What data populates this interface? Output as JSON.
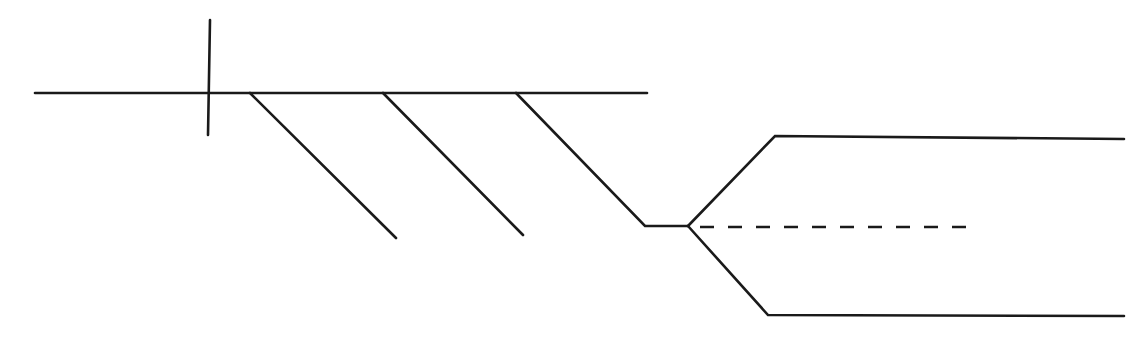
{
  "diagram": {
    "type": "line-drawing",
    "colors": {
      "line": "#1a1a1a",
      "background": "#ffffff"
    },
    "elements": {
      "main_horizontal": {
        "points": [
          [
            35,
            93
          ],
          [
            647,
            93
          ]
        ]
      },
      "vertical_tick": {
        "points": [
          [
            210,
            20
          ],
          [
            208,
            135
          ]
        ]
      },
      "diagonal_1": {
        "points": [
          [
            250,
            93
          ],
          [
            396,
            238
          ]
        ]
      },
      "diagonal_2": {
        "points": [
          [
            383,
            93
          ],
          [
            523,
            235
          ]
        ]
      },
      "diagonal_3_to_fork": {
        "points": [
          [
            516,
            93
          ],
          [
            645,
            226
          ],
          [
            688,
            226
          ]
        ]
      },
      "upper_branch": {
        "points": [
          [
            688,
            226
          ],
          [
            775,
            136
          ],
          [
            1124,
            139
          ]
        ]
      },
      "lower_branch": {
        "points": [
          [
            688,
            226
          ],
          [
            768,
            315
          ],
          [
            1124,
            316
          ]
        ]
      },
      "dashed_centerline": {
        "points": [
          [
            700,
            227
          ],
          [
            976,
            227
          ]
        ]
      }
    }
  }
}
